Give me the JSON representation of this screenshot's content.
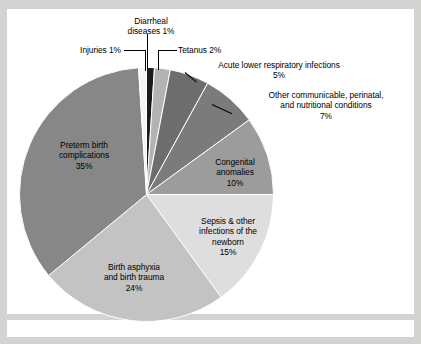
{
  "figure": {
    "background_color": "#d3d3d1",
    "card_color": "#ffffff"
  },
  "chart_data": {
    "type": "pie",
    "title": "",
    "subtitle": "",
    "xlabel": "",
    "ylabel": "",
    "legend_position": "none",
    "grid": false,
    "units": "percent",
    "total": 100,
    "start_angle_deg": 0,
    "direction": "clockwise",
    "categories": [
      "Diarrheal diseases",
      "Tetanus",
      "Acute lower respiratory infections",
      "Other communicable, perinatal, and nutritional conditions",
      "Congenital anomalies",
      "Sepsis & other infections of the newborn",
      "Birth asphyxia and birth trauma",
      "Preterm birth complications",
      "Injuries"
    ],
    "values": [
      1,
      2,
      5,
      7,
      10,
      15,
      24,
      35,
      1
    ],
    "colors": [
      "#1a1a1a",
      "#b3b3b3",
      "#6d6d6d",
      "#7b7b7b",
      "#9c9c9c",
      "#dedede",
      "#c3c3c3",
      "#878787",
      "#f4f4f4"
    ],
    "slices": [
      {
        "name": "Diarrheal diseases",
        "value": 1,
        "label": "Diarrheal\ndiseases 1%",
        "color": "#1a1a1a",
        "placement": "outside"
      },
      {
        "name": "Tetanus",
        "value": 2,
        "label": "Tetanus 2%",
        "color": "#b3b3b3",
        "placement": "outside"
      },
      {
        "name": "Acute lower respiratory infections",
        "value": 5,
        "label": "Acute lower respiratory infections\n5%",
        "color": "#6d6d6d",
        "placement": "outside"
      },
      {
        "name": "Other communicable, perinatal, and nutritional conditions",
        "value": 7,
        "label": "Other communicable, perinatal,\nand nutritional conditions\n7%",
        "color": "#7b7b7b",
        "placement": "outside"
      },
      {
        "name": "Congenital anomalies",
        "value": 10,
        "label": "Congenital\nanomalies\n10%",
        "color": "#9c9c9c",
        "placement": "inside"
      },
      {
        "name": "Sepsis & other infections of the newborn",
        "value": 15,
        "label": "Sepsis & other\ninfections of the\nnewborn\n15%",
        "color": "#dedede",
        "placement": "inside"
      },
      {
        "name": "Birth asphyxia and birth trauma",
        "value": 24,
        "label": "Birth asphyxia\nand birth trauma\n24%",
        "color": "#c3c3c3",
        "placement": "inside"
      },
      {
        "name": "Preterm birth complications",
        "value": 35,
        "label": "Preterm birth\ncomplications\n35%",
        "color": "#878787",
        "placement": "inside"
      },
      {
        "name": "Injuries",
        "value": 1,
        "label": "Injuries 1%",
        "color": "#f4f4f4",
        "placement": "outside"
      }
    ]
  },
  "labels": {
    "diarrheal": "Diarrheal\ndiseases 1%",
    "injuries": "Injuries 1%",
    "tetanus": "Tetanus 2%",
    "alri": "Acute lower respiratory infections\n5%",
    "other_communicable": "Other communicable, perinatal,\nand nutritional conditions\n7%",
    "congenital": "Congenital\nanomalies\n10%",
    "sepsis": "Sepsis & other\ninfections of the\nnewborn\n15%",
    "birth_asphyxia": "Birth asphyxia\nand birth trauma\n24%",
    "preterm": "Preterm birth\ncomplications\n35%"
  }
}
